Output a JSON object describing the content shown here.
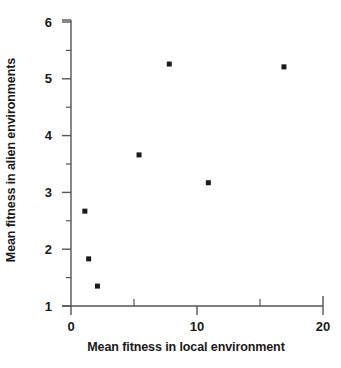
{
  "chart_data": {
    "type": "scatter",
    "title": "",
    "xlabel": "Mean fitness in local environment",
    "ylabel": "Mean fitness in alien environments",
    "xlim": [
      0,
      20
    ],
    "ylim": [
      1,
      6
    ],
    "xticks": [
      0,
      10,
      20
    ],
    "xtick_labels": [
      "0",
      "10",
      "20"
    ],
    "xminor_ticks": [
      5,
      15
    ],
    "yticks": [
      1,
      2,
      3,
      4,
      5,
      6
    ],
    "ytick_labels": [
      "1",
      "2",
      "3",
      "4",
      "5",
      "6"
    ],
    "yminor_ticks": [
      1.5,
      2.5,
      3.5,
      4.5,
      5.5
    ],
    "grid": false,
    "legend": null,
    "marker": "square",
    "marker_color": "#1a1a1a",
    "points": [
      {
        "x": 1.1,
        "y": 2.67
      },
      {
        "x": 1.4,
        "y": 1.83
      },
      {
        "x": 2.1,
        "y": 1.35
      },
      {
        "x": 5.4,
        "y": 3.66
      },
      {
        "x": 7.8,
        "y": 5.26
      },
      {
        "x": 10.9,
        "y": 3.17
      },
      {
        "x": 16.9,
        "y": 5.21
      }
    ]
  },
  "axis": {
    "color": "#555555",
    "x_tick_labels": [
      "0",
      "10",
      "20"
    ],
    "y_tick_labels": [
      "6",
      "5",
      "4",
      "3",
      "2",
      "1"
    ]
  },
  "labels": {
    "y_axis_title": "Mean fitness in alien environments",
    "x_axis_title": "Mean fitness in local environment"
  }
}
